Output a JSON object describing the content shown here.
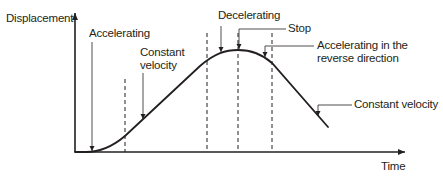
{
  "diagram": {
    "type": "displacement-time graph",
    "axes": {
      "y_label": "Displacement",
      "x_label": "Time"
    },
    "annotations": {
      "accelerating": "Accelerating",
      "constant_velocity_1_line1": "Constant",
      "constant_velocity_1_line2": "velocity",
      "decelerating": "Decelerating",
      "stop": "Stop",
      "accelerating_reverse_line1": "Accelerating in the",
      "accelerating_reverse_line2": "reverse direction",
      "constant_velocity_2": "Constant velocity"
    },
    "phases": [
      "Accelerating",
      "Constant velocity",
      "Decelerating",
      "Stop",
      "Accelerating in the reverse direction",
      "Constant velocity"
    ],
    "colors": {
      "line": "#231f20",
      "background": "#ffffff"
    }
  }
}
